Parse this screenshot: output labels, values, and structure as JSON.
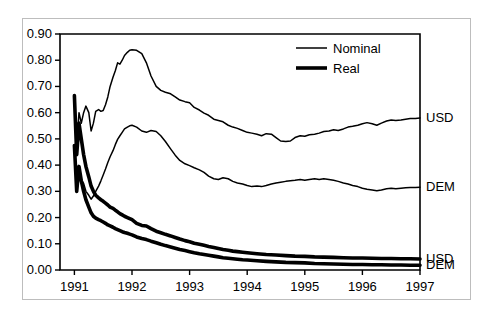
{
  "chart_data": {
    "type": "line",
    "title": "",
    "xlabel": "",
    "ylabel": "",
    "xlim": [
      1990.75,
      1997.0
    ],
    "ylim": [
      0.0,
      0.9
    ],
    "grid": false,
    "legend_position": "top-right",
    "x_ticks": [
      "1991",
      "1992",
      "1993",
      "1994",
      "1995",
      "1996",
      "1997"
    ],
    "x_tick_values": [
      1991,
      1992,
      1993,
      1994,
      1995,
      1996,
      1997
    ],
    "y_ticks": [
      "0.00",
      "0.10",
      "0.20",
      "0.30",
      "0.40",
      "0.50",
      "0.60",
      "0.70",
      "0.80",
      "0.90"
    ],
    "y_tick_values": [
      0.0,
      0.1,
      0.2,
      0.3,
      0.4,
      0.5,
      0.6,
      0.7,
      0.8,
      0.9
    ],
    "legend": [
      {
        "label": "Nominal",
        "style": "thin"
      },
      {
        "label": "Real",
        "style": "thick"
      }
    ],
    "right_labels": [
      {
        "text": "USD",
        "value": 0.58
      },
      {
        "text": "DEM",
        "value": 0.315
      },
      {
        "text": "USD",
        "value": 0.042
      },
      {
        "text": "DEM",
        "value": 0.018
      }
    ],
    "series": [
      {
        "name": "Nominal USD",
        "style": "thin",
        "end_label": "USD",
        "x": [
          1991.0,
          1991.04,
          1991.08,
          1991.12,
          1991.16,
          1991.2,
          1991.25,
          1991.29,
          1991.33,
          1991.37,
          1991.42,
          1991.46,
          1991.5,
          1991.54,
          1991.58,
          1991.62,
          1991.67,
          1991.71,
          1991.75,
          1991.79,
          1991.83,
          1991.87,
          1991.92,
          1991.96,
          1992.0,
          1992.08,
          1992.17,
          1992.25,
          1992.33,
          1992.42,
          1992.5,
          1992.58,
          1992.67,
          1992.75,
          1992.83,
          1992.92,
          1993.0,
          1993.08,
          1993.17,
          1993.25,
          1993.33,
          1993.42,
          1993.5,
          1993.58,
          1993.67,
          1993.75,
          1993.83,
          1993.92,
          1994.0,
          1994.08,
          1994.17,
          1994.25,
          1994.33,
          1994.42,
          1994.5,
          1994.58,
          1994.67,
          1994.75,
          1994.83,
          1994.92,
          1995.0,
          1995.08,
          1995.17,
          1995.25,
          1995.33,
          1995.42,
          1995.5,
          1995.58,
          1995.67,
          1995.75,
          1995.83,
          1995.92,
          1996.0,
          1996.08,
          1996.17,
          1996.25,
          1996.33,
          1996.42,
          1996.5,
          1996.58,
          1996.67,
          1996.75,
          1996.83,
          1996.92,
          1997.0
        ],
        "y": [
          0.665,
          0.48,
          0.6,
          0.56,
          0.6,
          0.625,
          0.6,
          0.53,
          0.56,
          0.605,
          0.612,
          0.605,
          0.608,
          0.63,
          0.66,
          0.7,
          0.735,
          0.76,
          0.79,
          0.785,
          0.8,
          0.818,
          0.83,
          0.838,
          0.84,
          0.838,
          0.825,
          0.79,
          0.74,
          0.7,
          0.685,
          0.678,
          0.672,
          0.66,
          0.648,
          0.642,
          0.638,
          0.62,
          0.61,
          0.598,
          0.59,
          0.575,
          0.57,
          0.565,
          0.552,
          0.545,
          0.54,
          0.532,
          0.525,
          0.522,
          0.518,
          0.512,
          0.52,
          0.518,
          0.505,
          0.492,
          0.49,
          0.492,
          0.505,
          0.512,
          0.51,
          0.516,
          0.518,
          0.522,
          0.528,
          0.53,
          0.535,
          0.532,
          0.538,
          0.545,
          0.548,
          0.552,
          0.558,
          0.562,
          0.558,
          0.552,
          0.56,
          0.568,
          0.572,
          0.57,
          0.572,
          0.575,
          0.578,
          0.578,
          0.58
        ]
      },
      {
        "name": "Nominal DEM",
        "style": "thin",
        "end_label": "DEM",
        "x": [
          1991.0,
          1991.04,
          1991.08,
          1991.12,
          1991.16,
          1991.2,
          1991.25,
          1991.29,
          1991.33,
          1991.37,
          1991.42,
          1991.46,
          1991.5,
          1991.54,
          1991.58,
          1991.62,
          1991.67,
          1991.71,
          1991.75,
          1991.79,
          1991.83,
          1991.87,
          1991.92,
          1991.96,
          1992.0,
          1992.08,
          1992.17,
          1992.25,
          1992.33,
          1992.42,
          1992.5,
          1992.58,
          1992.67,
          1992.75,
          1992.83,
          1992.92,
          1993.0,
          1993.08,
          1993.17,
          1993.25,
          1993.33,
          1993.42,
          1993.5,
          1993.58,
          1993.67,
          1993.75,
          1993.83,
          1993.92,
          1994.0,
          1994.08,
          1994.17,
          1994.25,
          1994.33,
          1994.42,
          1994.5,
          1994.58,
          1994.67,
          1994.75,
          1994.83,
          1994.92,
          1995.0,
          1995.08,
          1995.17,
          1995.25,
          1995.33,
          1995.42,
          1995.5,
          1995.58,
          1995.67,
          1995.75,
          1995.83,
          1995.92,
          1996.0,
          1996.08,
          1996.17,
          1996.25,
          1996.33,
          1996.42,
          1996.5,
          1996.58,
          1996.67,
          1996.75,
          1996.83,
          1996.92,
          1997.0
        ],
        "y": [
          0.475,
          0.32,
          0.38,
          0.345,
          0.33,
          0.3,
          0.285,
          0.27,
          0.282,
          0.3,
          0.32,
          0.34,
          0.362,
          0.385,
          0.41,
          0.432,
          0.455,
          0.478,
          0.498,
          0.512,
          0.525,
          0.538,
          0.545,
          0.55,
          0.552,
          0.545,
          0.53,
          0.525,
          0.532,
          0.528,
          0.512,
          0.49,
          0.462,
          0.438,
          0.418,
          0.405,
          0.398,
          0.39,
          0.382,
          0.372,
          0.358,
          0.348,
          0.345,
          0.352,
          0.348,
          0.338,
          0.332,
          0.328,
          0.322,
          0.318,
          0.32,
          0.318,
          0.322,
          0.328,
          0.332,
          0.335,
          0.338,
          0.34,
          0.342,
          0.345,
          0.342,
          0.345,
          0.348,
          0.345,
          0.348,
          0.345,
          0.342,
          0.338,
          0.332,
          0.328,
          0.322,
          0.318,
          0.312,
          0.308,
          0.305,
          0.302,
          0.305,
          0.31,
          0.312,
          0.31,
          0.312,
          0.314,
          0.315,
          0.315,
          0.316
        ]
      },
      {
        "name": "Real USD",
        "style": "thick",
        "end_label": "USD",
        "x": [
          1991.0,
          1991.04,
          1991.08,
          1991.12,
          1991.16,
          1991.2,
          1991.25,
          1991.29,
          1991.33,
          1991.37,
          1991.42,
          1991.46,
          1991.5,
          1991.54,
          1991.58,
          1991.62,
          1991.67,
          1991.71,
          1991.75,
          1991.79,
          1991.83,
          1991.87,
          1991.92,
          1991.96,
          1992.0,
          1992.08,
          1992.17,
          1992.25,
          1992.33,
          1992.42,
          1992.5,
          1992.58,
          1992.67,
          1992.75,
          1992.83,
          1992.92,
          1993.0,
          1993.08,
          1993.17,
          1993.25,
          1993.33,
          1993.42,
          1993.5,
          1993.58,
          1993.67,
          1993.75,
          1993.83,
          1993.92,
          1994.0,
          1994.17,
          1994.33,
          1994.5,
          1994.67,
          1994.83,
          1995.0,
          1995.17,
          1995.33,
          1995.5,
          1995.67,
          1995.83,
          1996.0,
          1996.17,
          1996.33,
          1996.5,
          1996.67,
          1996.83,
          1997.0
        ],
        "y": [
          0.665,
          0.44,
          0.56,
          0.5,
          0.44,
          0.395,
          0.355,
          0.32,
          0.3,
          0.285,
          0.275,
          0.268,
          0.262,
          0.255,
          0.248,
          0.24,
          0.235,
          0.228,
          0.222,
          0.215,
          0.21,
          0.205,
          0.2,
          0.196,
          0.192,
          0.178,
          0.17,
          0.168,
          0.158,
          0.148,
          0.142,
          0.136,
          0.13,
          0.124,
          0.118,
          0.112,
          0.108,
          0.102,
          0.098,
          0.094,
          0.09,
          0.086,
          0.082,
          0.078,
          0.075,
          0.072,
          0.07,
          0.068,
          0.066,
          0.062,
          0.059,
          0.057,
          0.055,
          0.053,
          0.052,
          0.05,
          0.049,
          0.048,
          0.047,
          0.046,
          0.046,
          0.045,
          0.044,
          0.044,
          0.043,
          0.043,
          0.042
        ]
      },
      {
        "name": "Real DEM",
        "style": "thick",
        "end_label": "DEM",
        "x": [
          1991.0,
          1991.04,
          1991.08,
          1991.12,
          1991.16,
          1991.2,
          1991.25,
          1991.29,
          1991.33,
          1991.37,
          1991.42,
          1991.46,
          1991.5,
          1991.54,
          1991.58,
          1991.62,
          1991.67,
          1991.71,
          1991.75,
          1991.79,
          1991.83,
          1991.87,
          1991.92,
          1991.96,
          1992.0,
          1992.08,
          1992.17,
          1992.25,
          1992.33,
          1992.42,
          1992.5,
          1992.58,
          1992.67,
          1992.75,
          1992.83,
          1992.92,
          1993.0,
          1993.08,
          1993.17,
          1993.25,
          1993.33,
          1993.42,
          1993.5,
          1993.58,
          1993.67,
          1993.75,
          1993.83,
          1993.92,
          1994.0,
          1994.17,
          1994.33,
          1994.5,
          1994.67,
          1994.83,
          1995.0,
          1995.17,
          1995.33,
          1995.5,
          1995.67,
          1995.83,
          1996.0,
          1996.17,
          1996.33,
          1996.5,
          1996.67,
          1996.83,
          1997.0
        ],
        "y": [
          0.475,
          0.3,
          0.395,
          0.34,
          0.3,
          0.268,
          0.24,
          0.218,
          0.205,
          0.198,
          0.192,
          0.188,
          0.183,
          0.178,
          0.172,
          0.168,
          0.163,
          0.158,
          0.154,
          0.15,
          0.146,
          0.143,
          0.14,
          0.137,
          0.134,
          0.126,
          0.12,
          0.116,
          0.11,
          0.104,
          0.098,
          0.093,
          0.088,
          0.083,
          0.078,
          0.074,
          0.07,
          0.066,
          0.062,
          0.059,
          0.056,
          0.053,
          0.05,
          0.047,
          0.045,
          0.043,
          0.041,
          0.039,
          0.038,
          0.035,
          0.033,
          0.031,
          0.029,
          0.028,
          0.027,
          0.025,
          0.024,
          0.023,
          0.022,
          0.021,
          0.021,
          0.02,
          0.02,
          0.019,
          0.019,
          0.018,
          0.018
        ]
      }
    ]
  }
}
